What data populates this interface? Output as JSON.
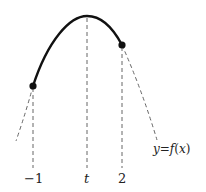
{
  "diagram": {
    "type": "function-graph",
    "curve_label": "y=f(x)",
    "curve_label_parts": {
      "y": "y",
      "eq": "=",
      "f": "f",
      "open": "(",
      "x": "x",
      "close": ")"
    },
    "x_labels": [
      {
        "text": "−1",
        "italic": false
      },
      {
        "text": "t",
        "italic": true
      },
      {
        "text": "2",
        "italic": false
      }
    ],
    "points": [
      {
        "name": "left-endpoint",
        "x_value": "-1"
      },
      {
        "name": "right-endpoint",
        "x_value": "2"
      }
    ],
    "vertex_x": "t",
    "colors": {
      "curve": "#111111",
      "dashed": "#666666",
      "text": "#222222"
    }
  }
}
